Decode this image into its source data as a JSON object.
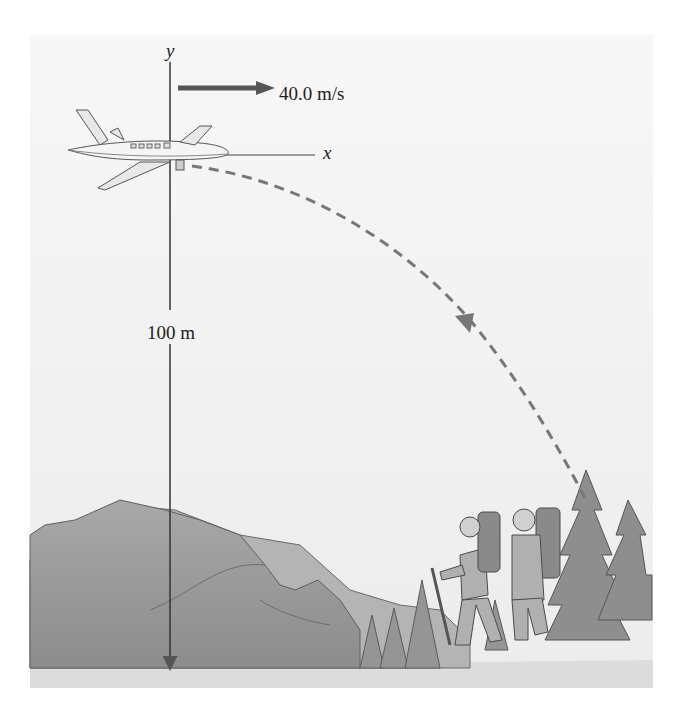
{
  "figure": {
    "axes": {
      "x_label": "x",
      "y_label": "y"
    },
    "velocity": {
      "label": "40.0 m/s",
      "value": 40.0,
      "unit": "m/s"
    },
    "height": {
      "label": "100 m",
      "value": 100,
      "unit": "m"
    },
    "elements": [
      "airplane",
      "velocity-arrow",
      "parabolic-trajectory",
      "mountains",
      "hikers",
      "pine-trees"
    ],
    "colors": {
      "background": "#f4f4f4",
      "axis": "#333333",
      "arrow": "#666666",
      "trajectory": "#777777",
      "mountain": "#9a9a9a",
      "trees": "#8a8a8a",
      "ground": "#d8d8d8"
    }
  }
}
